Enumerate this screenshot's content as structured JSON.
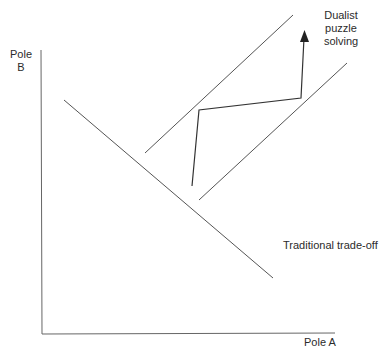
{
  "diagram": {
    "axes": {
      "y_label_line1": "Pole",
      "y_label_line2": "B",
      "x_label": "Pole A"
    },
    "labels": {
      "dualist_line1": "Dualist",
      "dualist_line2": "puzzle",
      "dualist_line3": "solving",
      "traditional": "Traditional trade-off"
    },
    "colors": {
      "line": "#555555",
      "arrow": "#222222",
      "text": "#2b2b2b"
    }
  }
}
